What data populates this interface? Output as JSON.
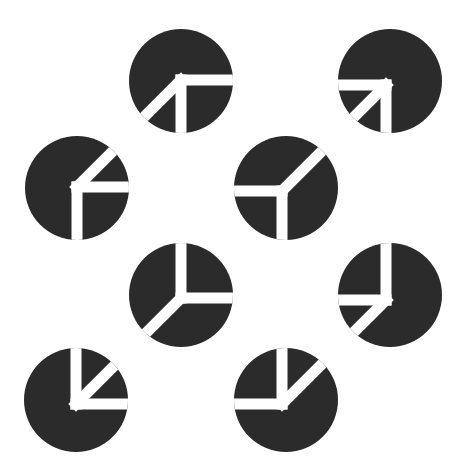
{
  "figure": {
    "fill_color": "#2b2b2b",
    "background_color": "#ffffff",
    "gap_width": 11,
    "radius": 52
  },
  "circles": [
    {
      "id": "circle-1",
      "cx": 181,
      "cy": 81,
      "jx": 181,
      "jy": 80,
      "rays": [
        0,
        90,
        135
      ]
    },
    {
      "id": "circle-2",
      "cx": 390,
      "cy": 81,
      "jx": 386,
      "jy": 85,
      "rays": [
        90,
        180,
        135
      ]
    },
    {
      "id": "circle-3",
      "cx": 77,
      "cy": 188,
      "jx": 77,
      "jy": 187,
      "rays": [
        -45,
        0,
        90
      ]
    },
    {
      "id": "circle-4",
      "cx": 286,
      "cy": 188,
      "jx": 282,
      "jy": 191,
      "rays": [
        180,
        90,
        -45
      ]
    },
    {
      "id": "circle-5",
      "cx": 181,
      "cy": 295,
      "jx": 181,
      "jy": 298,
      "rays": [
        -90,
        0,
        135
      ]
    },
    {
      "id": "circle-6",
      "cx": 390,
      "cy": 295,
      "jx": 386,
      "jy": 300,
      "rays": [
        -90,
        180,
        135
      ]
    },
    {
      "id": "circle-7",
      "cx": 76,
      "cy": 400,
      "jx": 76,
      "jy": 404,
      "rays": [
        -90,
        0,
        -45
      ]
    },
    {
      "id": "circle-8",
      "cx": 286,
      "cy": 400,
      "jx": 282,
      "jy": 404,
      "rays": [
        -90,
        180,
        -45
      ]
    }
  ]
}
